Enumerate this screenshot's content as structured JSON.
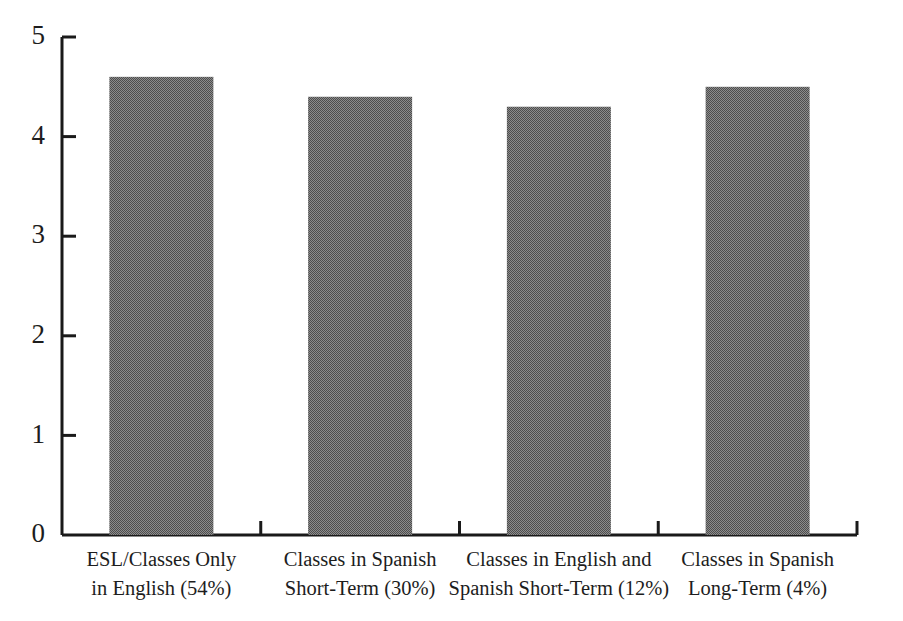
{
  "chart_data": {
    "type": "bar",
    "title": "",
    "subtitle": "",
    "xlabel": "",
    "ylabel": "",
    "categories": [
      "ESL/Classes Only in English (54%)",
      "Classes in Spanish Short-Term (30%)",
      "Classes in English and Spanish Short-Term (12%)",
      "Classes in Spanish Long-Term (4%)"
    ],
    "category_lines": [
      [
        "ESL/Classes Only",
        "in English (54%)"
      ],
      [
        "Classes in Spanish",
        "Short-Term (30%)"
      ],
      [
        "Classes in English and",
        "Spanish Short-Term (12%)"
      ],
      [
        "Classes in Spanish",
        "Long-Term (4%)"
      ]
    ],
    "values": [
      4.6,
      4.4,
      4.3,
      4.5
    ],
    "ylim": [
      0,
      5
    ],
    "yticks": [
      0,
      1,
      2,
      3,
      4,
      5
    ],
    "ytick_labels": [
      "0",
      "1",
      "2",
      "3",
      "4",
      "5"
    ],
    "grid": false,
    "legend": false,
    "legend_position": "none",
    "bar_color": "#6b6b6b",
    "bar_fill_style": "dithered-gray",
    "axis_color": "#1a1a1a",
    "background_color": "#ffffff",
    "tick_direction": "inward"
  },
  "axes": {
    "y_axis_name": "y-axis",
    "x_axis_name": "x-axis"
  }
}
